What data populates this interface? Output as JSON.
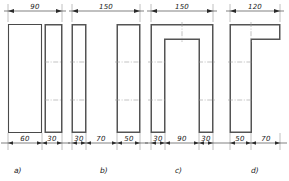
{
  "sheet": {
    "title": "Cross-section profile dimension figures",
    "background_color": "#ffffff",
    "line_color": "#4a4a4a",
    "dimension_color": "#2b2b2b",
    "centerline_color": "#9a9a9a",
    "units": "mm"
  },
  "figures": [
    {
      "caption": "a)",
      "shape": "rectangle-with-bold-right-strip",
      "top_dimension": "90",
      "bottom_dimensions": [
        "60",
        "30"
      ],
      "overall_width": 90,
      "parts": [
        {
          "name": "left-plate",
          "width": 60,
          "bold": false
        },
        {
          "name": "right-plate",
          "width": 30,
          "bold": true
        }
      ]
    },
    {
      "caption": "b)",
      "shape": "two-separate-plates",
      "top_dimension": "150",
      "bottom_dimensions": [
        "30",
        "70",
        "50"
      ],
      "overall_width": 150,
      "parts": [
        {
          "name": "left-plate",
          "width": 30,
          "bold": true
        },
        {
          "name": "gap",
          "width": 70,
          "bold": false
        },
        {
          "name": "right-plate",
          "width": 50,
          "bold": true
        }
      ]
    },
    {
      "caption": "c)",
      "shape": "u-channel",
      "top_dimension": "150",
      "bottom_dimensions": [
        "30",
        "90",
        "30"
      ],
      "overall_width": 150,
      "parts": [
        {
          "name": "left-leg",
          "width": 30,
          "bold": true
        },
        {
          "name": "inner-slot",
          "width": 90,
          "bold": false
        },
        {
          "name": "right-leg",
          "width": 30,
          "bold": true
        }
      ]
    },
    {
      "caption": "d)",
      "shape": "l-angle",
      "top_dimension": "120",
      "bottom_dimensions": [
        "50",
        "70"
      ],
      "overall_width": 120,
      "parts": [
        {
          "name": "vertical-leg",
          "width": 50,
          "bold": true
        },
        {
          "name": "horizontal-flange",
          "width": 70,
          "bold": false
        }
      ]
    }
  ]
}
